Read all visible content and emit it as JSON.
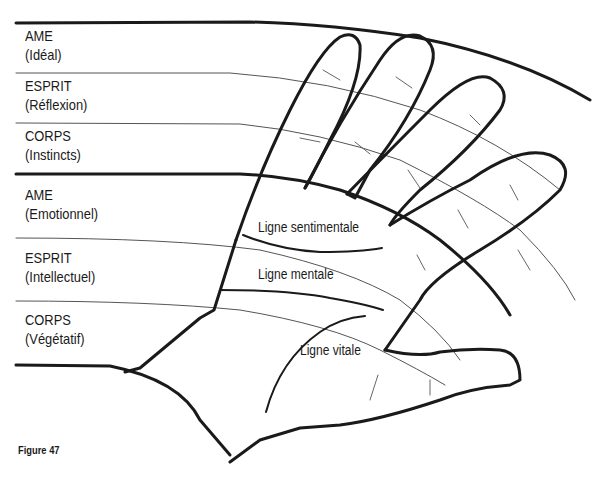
{
  "figure": {
    "caption": "Figure 47",
    "zones": [
      {
        "name": "AME",
        "sub": "(Idéal)"
      },
      {
        "name": "ESPRIT",
        "sub": "(Réflexion)"
      },
      {
        "name": "CORPS",
        "sub": "(Instincts)"
      },
      {
        "name": "AME",
        "sub": "(Emotionnel)"
      },
      {
        "name": "ESPRIT",
        "sub": "(Intellectuel)"
      },
      {
        "name": "CORPS",
        "sub": "(Végétatif)"
      }
    ],
    "palm_lines": {
      "heart": "Ligne sentimentale",
      "head": "Ligne mentale",
      "life": "Ligne vitale"
    },
    "colors": {
      "ink": "#1a1a1a",
      "thin_line": "#555555",
      "background": "#ffffff"
    }
  }
}
